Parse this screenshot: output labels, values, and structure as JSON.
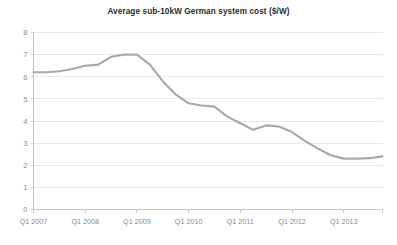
{
  "chart_data": {
    "type": "line",
    "title": "Average sub-10kW German system cost ($/W)",
    "xlabel": "",
    "ylabel": "",
    "ylim": [
      0,
      8
    ],
    "ytick_values": [
      0,
      1,
      2,
      3,
      4,
      5,
      6,
      7,
      8
    ],
    "ytick_labels": [
      "0",
      "1",
      "2",
      "3",
      "4",
      "5",
      "6",
      "7",
      "8"
    ],
    "grid": true,
    "grid_axis": "y",
    "legend": false,
    "legend_position": "none",
    "line_color": "#a8a8a8",
    "categories": [
      "Q1 2007",
      "Q2 2007",
      "Q3 2007",
      "Q4 2007",
      "Q1 2008",
      "Q2 2008",
      "Q3 2008",
      "Q4 2008",
      "Q1 2009",
      "Q2 2009",
      "Q3 2009",
      "Q4 2009",
      "Q1 2010",
      "Q2 2010",
      "Q3 2010",
      "Q4 2010",
      "Q1 2011",
      "Q2 2011",
      "Q3 2011",
      "Q4 2011",
      "Q1 2012",
      "Q2 2012",
      "Q3 2012",
      "Q4 2012",
      "Q1 2013",
      "Q2 2013",
      "Q3 2013",
      "Q4 2013"
    ],
    "xtick_labels": [
      "Q1 2007",
      "Q1 2008",
      "Q1 2009",
      "Q1 2010",
      "Q1 2011",
      "Q1 2012",
      "Q1 2013"
    ],
    "xtick_category_indices": [
      0,
      4,
      8,
      12,
      16,
      20,
      24
    ],
    "values": [
      6.2,
      6.2,
      6.25,
      6.35,
      6.5,
      6.55,
      6.9,
      7.0,
      7.0,
      6.55,
      5.8,
      5.2,
      4.8,
      4.7,
      4.65,
      4.2,
      3.9,
      3.6,
      3.8,
      3.75,
      3.5,
      3.1,
      2.75,
      2.45,
      2.3,
      2.3,
      2.32,
      2.4
    ],
    "series": [
      {
        "name": "Average sub-10kW German system cost",
        "unit": "$/W",
        "values": [
          6.2,
          6.2,
          6.25,
          6.35,
          6.5,
          6.55,
          6.9,
          7.0,
          7.0,
          6.55,
          5.8,
          5.2,
          4.8,
          4.7,
          4.65,
          4.2,
          3.9,
          3.6,
          3.8,
          3.75,
          3.5,
          3.1,
          2.75,
          2.45,
          2.3,
          2.3,
          2.32,
          2.4
        ]
      }
    ]
  }
}
